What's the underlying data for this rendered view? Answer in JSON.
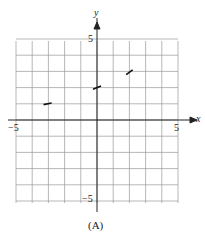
{
  "chart_data": {
    "type": "line",
    "title": "",
    "caption": "(A)",
    "xlabel": "x",
    "ylabel": "y",
    "xlim": [
      -5,
      5
    ],
    "ylim": [
      -5,
      5
    ],
    "grid": true,
    "tick_labels": {
      "x_min": "−5",
      "x_max": "5",
      "y_min": "−5",
      "y_max": "5"
    },
    "segments": [
      {
        "x": [
          -3.3,
          -2.8
        ],
        "y": [
          0.95,
          1.05
        ]
      },
      {
        "x": [
          -0.25,
          0.25
        ],
        "y": [
          1.9,
          2.1
        ]
      },
      {
        "x": [
          1.8,
          2.2
        ],
        "y": [
          2.8,
          3.1
        ]
      }
    ]
  }
}
